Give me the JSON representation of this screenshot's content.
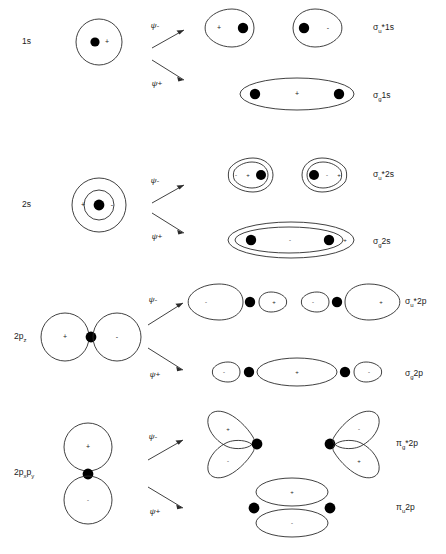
{
  "figure": {
    "type": "molecular-orbital-formation-diagram",
    "background_color": "#ffffff",
    "stroke_color": "#2b2b2b",
    "nucleus_color": "#000000"
  },
  "combination_labels": {
    "antibonding": "ψ-",
    "bonding": "ψ+"
  },
  "rows": [
    {
      "id": "row-1s",
      "atomic_label": "1s",
      "atomic_label_sub": "",
      "atomic_orbital": {
        "shape": "circle",
        "signs": [
          "+"
        ],
        "nuclei": 1
      },
      "antibonding": {
        "mo_label_base": "σ",
        "mo_label_sub": "u",
        "mo_label_rest": "*1s",
        "lobe_signs": [
          "+",
          "-"
        ],
        "nuclei": 2
      },
      "bonding": {
        "mo_label_base": "σ",
        "mo_label_sub": "g",
        "mo_label_rest": "1s",
        "lobe_signs": [
          "+"
        ],
        "nuclei": 2
      }
    },
    {
      "id": "row-2s",
      "atomic_label": "2s",
      "atomic_label_sub": "",
      "atomic_orbital": {
        "shape": "nested-circle",
        "signs": [
          "+",
          "-"
        ],
        "nuclei": 1
      },
      "antibonding": {
        "mo_label_base": "σ",
        "mo_label_sub": "u",
        "mo_label_rest": "*2s",
        "lobe_signs": [
          "-",
          "+",
          "-",
          "+"
        ],
        "nuclei": 2
      },
      "bonding": {
        "mo_label_base": "σ",
        "mo_label_sub": "g",
        "mo_label_rest": "2s",
        "lobe_signs": [
          "-",
          "+"
        ],
        "nuclei": 2
      }
    },
    {
      "id": "row-2pz",
      "atomic_label": "2p",
      "atomic_label_sub": "z",
      "atomic_orbital": {
        "shape": "two-circles-horizontal",
        "signs": [
          "+",
          "-"
        ],
        "nuclei": 1
      },
      "antibonding": {
        "mo_label_base": "σ",
        "mo_label_sub": "u",
        "mo_label_rest": "*2p",
        "lobe_signs": [
          "-",
          "+",
          "-",
          "+"
        ],
        "nuclei": 2
      },
      "bonding": {
        "mo_label_base": "σ",
        "mo_label_sub": "g",
        "mo_label_rest": "2p",
        "lobe_signs": [
          "-",
          "+",
          "-"
        ],
        "nuclei": 2
      }
    },
    {
      "id": "row-2px-2py",
      "atomic_label": "2p",
      "atomic_label_sub": "x",
      "atomic_label_2": "p",
      "atomic_label_sub_2": "y",
      "atomic_orbital": {
        "shape": "two-circles-vertical",
        "signs": [
          "+",
          "-"
        ],
        "nuclei": 1
      },
      "antibonding": {
        "mo_label_base": "π",
        "mo_label_sub": "g",
        "mo_label_rest": "*2p",
        "lobe_signs": [
          "+",
          "-",
          "-",
          "+"
        ],
        "nuclei": 2
      },
      "bonding": {
        "mo_label_base": "π",
        "mo_label_sub": "u",
        "mo_label_rest": "2p",
        "lobe_signs": [
          "+",
          "-"
        ],
        "nuclei": 2
      }
    }
  ],
  "signs": {
    "plus": "+",
    "minus": "-"
  }
}
